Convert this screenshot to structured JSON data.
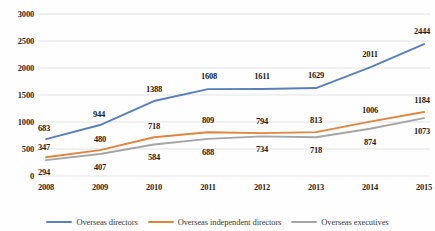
{
  "chart_data": {
    "type": "line",
    "title": "",
    "xlabel": "",
    "ylabel": "",
    "categories": [
      "2008",
      "2009",
      "2010",
      "2011",
      "2012",
      "2013",
      "2014",
      "2015"
    ],
    "ylim": [
      0,
      3000
    ],
    "yticks": [
      "0",
      "500",
      "1000",
      "1500",
      "2000",
      "2500",
      "3000"
    ],
    "grid": "horizontal",
    "legend_position": "bottom",
    "series": [
      {
        "name": "Overseas directors",
        "color": "#5B7FB9",
        "values": [
          683,
          944,
          1388,
          1608,
          1611,
          1629,
          2011,
          2444
        ]
      },
      {
        "name": "Overseas independent directors",
        "color": "#E0843F",
        "values": [
          347,
          480,
          718,
          809,
          794,
          813,
          1006,
          1184
        ]
      },
      {
        "name": "Overseas executives",
        "color": "#A5A5A5",
        "values": [
          294,
          407,
          584,
          688,
          734,
          718,
          874,
          1073
        ]
      }
    ]
  },
  "colors": {
    "grid": "#E3E3E3",
    "tick_text": "#2b2b2b",
    "label_text": "#1f1f1f",
    "legend_text": "#3a3a3a",
    "background": "#fefefe"
  },
  "label_offsets": {
    "series0": [
      {
        "dx": -2,
        "dy": -11
      },
      {
        "dx": -1,
        "dy": -11
      },
      {
        "dx": 0,
        "dy": -12
      },
      {
        "dx": 1,
        "dy": -13
      },
      {
        "dx": 0,
        "dy": -13
      },
      {
        "dx": 0,
        "dy": -13
      },
      {
        "dx": 0,
        "dy": -13
      },
      {
        "dx": -2,
        "dy": -13
      }
    ],
    "series1": [
      {
        "dx": -2,
        "dy": -10
      },
      {
        "dx": 0,
        "dy": -11
      },
      {
        "dx": 0,
        "dy": -11
      },
      {
        "dx": 0,
        "dy": -12
      },
      {
        "dx": 0,
        "dy": -12
      },
      {
        "dx": 0,
        "dy": -12
      },
      {
        "dx": 0,
        "dy": -12
      },
      {
        "dx": -2,
        "dy": -12
      }
    ],
    "series2": [
      {
        "dx": -2,
        "dy": 12
      },
      {
        "dx": 0,
        "dy": 13
      },
      {
        "dx": 0,
        "dy": 13
      },
      {
        "dx": 0,
        "dy": 13
      },
      {
        "dx": 0,
        "dy": 13
      },
      {
        "dx": 0,
        "dy": 13
      },
      {
        "dx": 0,
        "dy": 13
      },
      {
        "dx": -2,
        "dy": 13
      }
    ]
  }
}
